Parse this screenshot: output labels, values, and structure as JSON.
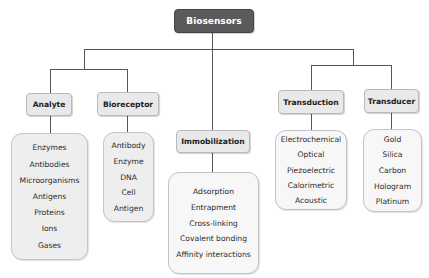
{
  "root": {
    "label": "Biosensors",
    "color": "#5b5b5b"
  },
  "categories": [
    {
      "label": "Analyte",
      "items": [
        "Enzymes",
        "Antibodies",
        "Microorganisms",
        "Antigens",
        "Proteins",
        "Ions",
        "Gases"
      ]
    },
    {
      "label": "Bioreceptor",
      "items": [
        "Antibody",
        "Enzyme",
        "DNA",
        "Cell",
        "Antigen"
      ]
    },
    {
      "label": "Immobilization",
      "items": [
        "Adsorption",
        "Entrapment",
        "Cross-linking",
        "Covalent bonding",
        "Affinity interactions"
      ]
    },
    {
      "label": "Transduction",
      "items": [
        "Electrochemical",
        "Optical",
        "Piezoelectric",
        "Calorimetric",
        "Acoustic"
      ]
    },
    {
      "label": "Transducer",
      "items": [
        "Gold",
        "Silica",
        "Carbon",
        "Hologram",
        "Platinum"
      ]
    }
  ]
}
